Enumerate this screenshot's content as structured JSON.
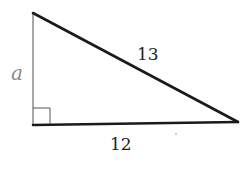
{
  "diagram": {
    "type": "right-triangle",
    "vertices": {
      "top": [
        33,
        13
      ],
      "right_angle": [
        33,
        125
      ],
      "right": [
        238,
        122
      ]
    },
    "labels": {
      "vertical_leg": "a",
      "hypotenuse": "13",
      "horizontal_leg": "12"
    },
    "colors": {
      "edge": "#1a1a1a",
      "vertical_edge": "#8a8a8a",
      "leg_label": "#8a8a8a",
      "text": "#222222"
    }
  }
}
